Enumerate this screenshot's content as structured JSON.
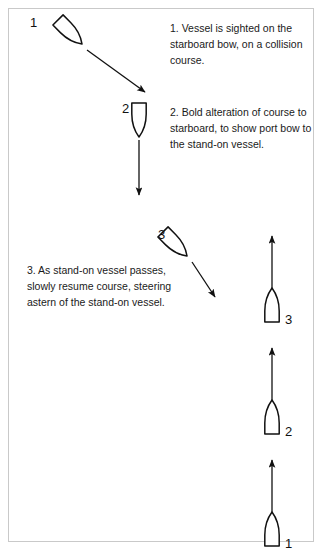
{
  "diagram": {
    "background_color": "#ffffff",
    "ink_color": "#111111",
    "border_color": "#c9c9c9"
  },
  "captions": [
    {
      "id": "caption-1",
      "text": "1. Vessel is sighted on the starboard bow, on a collision course."
    },
    {
      "id": "caption-2",
      "text": "2. Bold alteration of course to starboard, to show port bow to the stand-on vessel."
    },
    {
      "id": "caption-3",
      "text": "3. As stand-on vessel passes, slowly resume course, steering astern of the stand-on vessel."
    }
  ],
  "give_way_vessels": [
    {
      "label": "1",
      "label_x": 30,
      "label_y": 16,
      "x": 70,
      "y": 32,
      "rotation": 135
    },
    {
      "label": "2",
      "label_x": 122,
      "label_y": 102,
      "x": 139,
      "y": 120,
      "rotation": 180
    },
    {
      "label": "3",
      "label_x": 158,
      "label_y": 228,
      "x": 175,
      "y": 244,
      "rotation": 135
    }
  ],
  "stand_on_vessels": [
    {
      "label": "3",
      "label_x": 285,
      "label_y": 313,
      "x": 272,
      "y": 305,
      "rotation": 0
    },
    {
      "label": "2",
      "label_x": 285,
      "label_y": 425,
      "x": 272,
      "y": 417,
      "rotation": 0
    },
    {
      "label": "1",
      "label_x": 285,
      "label_y": 537,
      "x": 272,
      "y": 529,
      "rotation": 0
    }
  ],
  "arrows": [
    {
      "name": "arrow-give-way-1",
      "x1": 87,
      "y1": 50,
      "x2": 145,
      "y2": 92
    },
    {
      "name": "arrow-give-way-2",
      "x1": 139,
      "y1": 140,
      "x2": 139,
      "y2": 195
    },
    {
      "name": "arrow-give-way-3",
      "x1": 192,
      "y1": 262,
      "x2": 215,
      "y2": 297
    },
    {
      "name": "arrow-stand-on-3",
      "x1": 272,
      "y1": 290,
      "x2": 272,
      "y2": 236
    },
    {
      "name": "arrow-stand-on-2",
      "x1": 272,
      "y1": 402,
      "x2": 272,
      "y2": 348
    },
    {
      "name": "arrow-stand-on-1",
      "x1": 272,
      "y1": 514,
      "x2": 272,
      "y2": 460
    }
  ]
}
